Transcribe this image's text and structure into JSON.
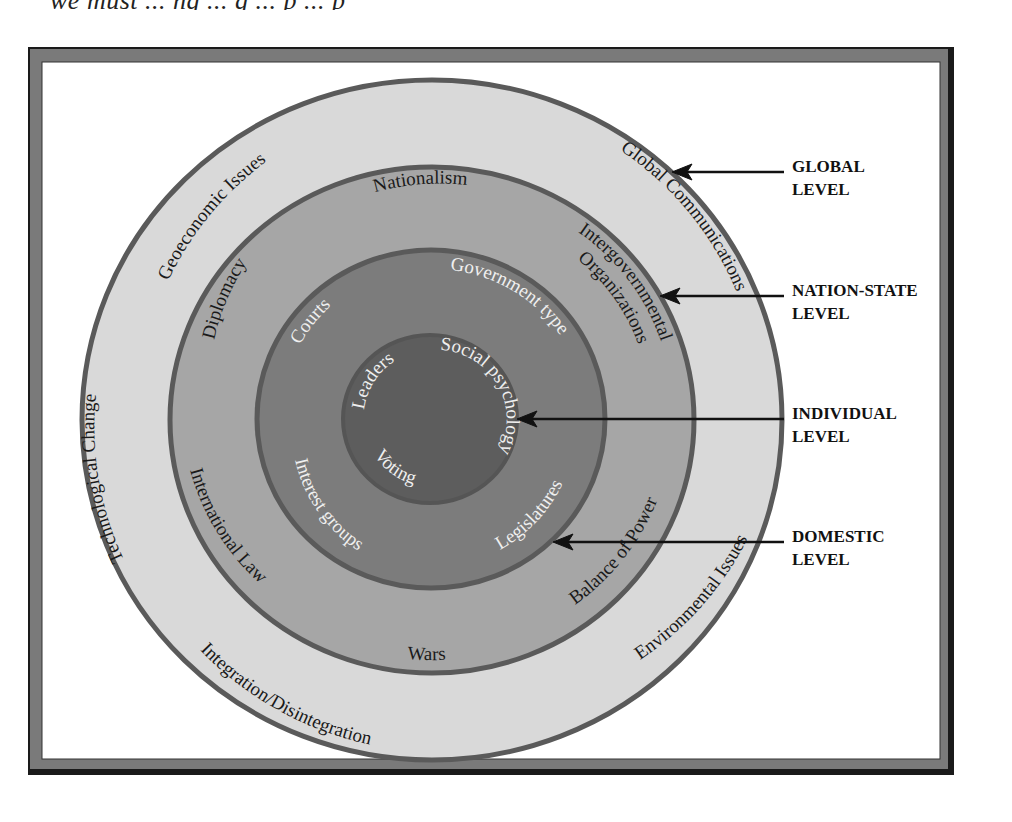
{
  "page": {
    "top_text_fragment": "we must  ...  ng  ...  g  ...  p  ...  p"
  },
  "colors": {
    "frame_outer": "#1a1a1a",
    "frame_band": "#7a7a7a",
    "global_ring": "#d9d9d9",
    "nation_state_ring": "#a6a6a6",
    "domestic_ring": "#7c7c7c",
    "individual_core": "#5d5d5d",
    "ring_stroke": "#5a5a5a",
    "arrow": "#111111"
  },
  "diagram": {
    "rings": [
      {
        "id": "global",
        "level_label_line1": "GLOBAL",
        "level_label_line2": "LEVEL",
        "items": [
          "Geoeconomic Issues",
          "Global Communications",
          "Environmental Issues",
          "Integration/Disintegration",
          "Technological Change"
        ]
      },
      {
        "id": "nation_state",
        "level_label_line1": "NATION-STATE",
        "level_label_line2": "LEVEL",
        "items": [
          "Nationalism",
          "Intergovernmental",
          "Organizations",
          "Balance of Power",
          "Wars",
          "International Law",
          "Diplomacy"
        ]
      },
      {
        "id": "domestic",
        "level_label_line1": "DOMESTIC",
        "level_label_line2": "LEVEL",
        "items": [
          "Government type",
          "Legislatures",
          "Interest groups",
          "Courts"
        ]
      },
      {
        "id": "individual",
        "level_label_line1": "INDIVIDUAL",
        "level_label_line2": "LEVEL",
        "items": [
          "Leaders",
          "Social psychology",
          "Voting"
        ]
      }
    ]
  }
}
